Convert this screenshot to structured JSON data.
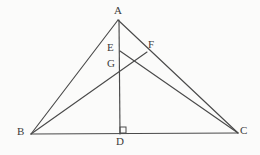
{
  "figure": {
    "background_color": "#fbfbfa",
    "stroke_color": "#4a4a4a",
    "label_color": "#3b3b3b",
    "width": 260,
    "height": 155,
    "points": [
      {
        "id": "A",
        "label": "A",
        "x": 118,
        "y": 20,
        "label_x": 114,
        "label_y": 5,
        "role": "apex-vertex"
      },
      {
        "id": "B",
        "label": "B",
        "x": 31,
        "y": 134,
        "label_x": 17,
        "label_y": 126,
        "role": "base-left-vertex"
      },
      {
        "id": "C",
        "label": "C",
        "x": 238,
        "y": 133,
        "label_x": 240,
        "label_y": 125,
        "role": "base-right-vertex"
      },
      {
        "id": "D",
        "label": "D",
        "x": 120,
        "y": 134,
        "label_x": 116,
        "label_y": 136,
        "role": "foot-of-altitude"
      },
      {
        "id": "E",
        "label": "E",
        "x": 120,
        "y": 51,
        "label_x": 107,
        "label_y": 42,
        "role": "point-on-altitude"
      },
      {
        "id": "F",
        "label": "F",
        "x": 147,
        "y": 52,
        "label_x": 148,
        "label_y": 39,
        "role": "point-on-side-ac"
      },
      {
        "id": "G",
        "label": "G",
        "x": 120,
        "y": 67,
        "label_x": 107,
        "label_y": 58,
        "role": "intersection-on-altitude"
      }
    ],
    "segments": [
      {
        "id": "AB",
        "name": "side-ab",
        "x1": 118,
        "y1": 20,
        "x2": 31,
        "y2": 134
      },
      {
        "id": "AC",
        "name": "side-ac",
        "x1": 118,
        "y1": 20,
        "x2": 238,
        "y2": 133
      },
      {
        "id": "BC",
        "name": "side-bc",
        "x1": 31,
        "y1": 134,
        "x2": 238,
        "y2": 133
      },
      {
        "id": "AD",
        "name": "altitude-ad",
        "x1": 119,
        "y1": 20,
        "x2": 120,
        "y2": 134
      },
      {
        "id": "EC",
        "name": "cevian-ec",
        "x1": 120,
        "y1": 51,
        "x2": 238,
        "y2": 133
      },
      {
        "id": "BF",
        "name": "cevian-bf",
        "x1": 31,
        "y1": 134,
        "x2": 147,
        "y2": 52
      }
    ],
    "right_angle": {
      "name": "right-angle-at-d",
      "vertex": "D",
      "x": 120,
      "y": 127,
      "size": 6,
      "marker": "square"
    }
  }
}
